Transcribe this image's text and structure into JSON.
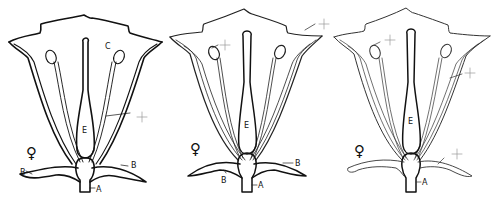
{
  "figure": {
    "panels": [
      {
        "id": "left",
        "outline_color": "#111111",
        "stroke_width": 1.6,
        "labels": {
          "corolla": "C",
          "pistil": "E",
          "sepal_left": "B",
          "sepal_right": "B",
          "receptacle": "A",
          "symbol": "♀"
        },
        "markers": [
          "stamen-filament-marker"
        ]
      },
      {
        "id": "middle",
        "outline_color": "#222222",
        "stroke_width": 1.2,
        "labels": {
          "pistil": "E",
          "sepal_left": "B",
          "sepal_right": "B",
          "receptacle": "A",
          "symbol": "♀"
        },
        "markers": [
          "anther-marker",
          "corolla-lobe-marker"
        ]
      },
      {
        "id": "right",
        "outline_color": "#333333",
        "stroke_width": 1.0,
        "labels": {
          "pistil": "E",
          "receptacle": "A",
          "symbol": "♀"
        },
        "markers": [
          "anther-marker",
          "corolla-tube-marker",
          "sepal-marker"
        ]
      }
    ]
  }
}
